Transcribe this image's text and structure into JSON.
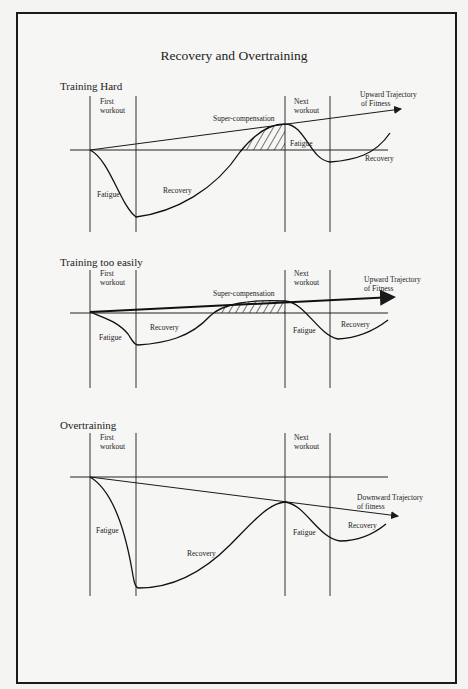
{
  "title": "Recovery and Overtraining",
  "diagrams": [
    {
      "heading": "Training Hard",
      "first_workout": [
        "First",
        "workout"
      ],
      "next_workout": [
        "Next",
        "workout"
      ],
      "trajectory": [
        "Upward Trajectory",
        "of Fitness"
      ],
      "supercomp": "Super-compensation",
      "fatigue1": "Fatigue",
      "recovery1": "Recovery",
      "fatigue2": "Fatigue",
      "recovery2": "Recovery"
    },
    {
      "heading": "Training too easily",
      "first_workout": [
        "First",
        "workout"
      ],
      "next_workout": [
        "Next",
        "workout"
      ],
      "trajectory": [
        "Upward Trajectory",
        "of Fitness"
      ],
      "supercomp": "Super-compensation",
      "fatigue1": "Fatigue",
      "recovery1": "Recovery",
      "fatigue2": "Fatigue",
      "recovery2": "Recovery"
    },
    {
      "heading": "Overtraining",
      "first_workout": [
        "First",
        "workout"
      ],
      "next_workout": [
        "Next",
        "workout"
      ],
      "trajectory": [
        "Downward Trajectory",
        "of fitness"
      ],
      "fatigue1": "Fatigue",
      "recovery1": "Recovery",
      "fatigue2": "Fatigue",
      "recovery2": "Recovery"
    }
  ],
  "colors": {
    "ink": "#1a1a1a",
    "paper": "#f6f6f4",
    "rule": "#555555"
  }
}
